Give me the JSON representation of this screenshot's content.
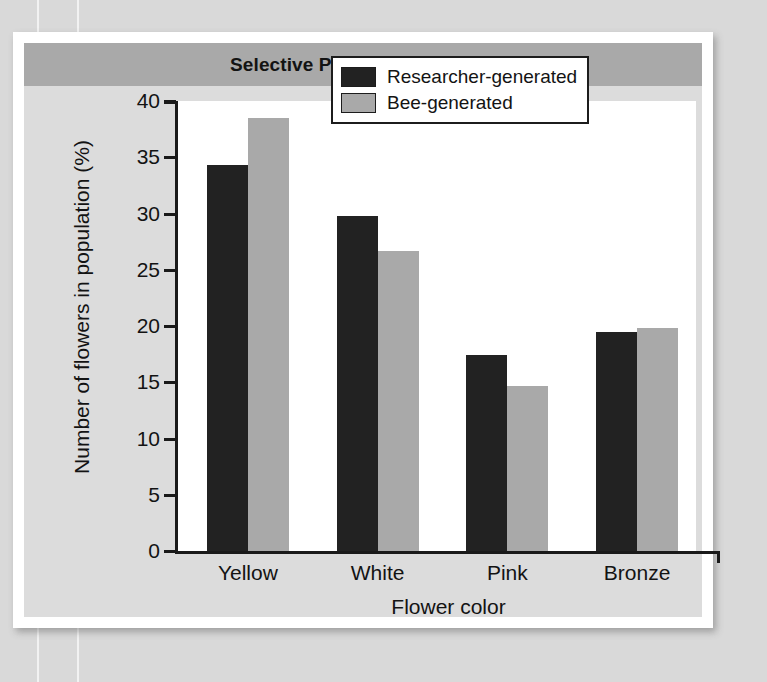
{
  "chart_data": {
    "type": "bar",
    "title": "Selective Pollination by Bees",
    "xlabel": "Flower color",
    "ylabel": "Number of flowers in population (%)",
    "categories": [
      "Yellow",
      "White",
      "Pink",
      "Bronze"
    ],
    "series": [
      {
        "name": "Researcher-generated",
        "color": "#222222",
        "values": [
          34.3,
          29.8,
          17.4,
          19.5
        ]
      },
      {
        "name": "Bee-generated",
        "color": "#a9a9a9",
        "values": [
          38.5,
          26.7,
          14.7,
          19.8
        ]
      }
    ],
    "ylim": [
      0,
      40
    ],
    "yticks": [
      0,
      5,
      10,
      15,
      20,
      25,
      30,
      35,
      40
    ],
    "ytick_labels": [
      "0",
      "5",
      "10",
      "15",
      "20",
      "25",
      "30",
      "35",
      "40"
    ],
    "grid": false,
    "legend_position": "top-right"
  },
  "figure": {
    "title_band_color": "#a9a9a9",
    "panel_color": "#dcdcdc",
    "plot_background": "#ffffff",
    "axis_color": "#1a1a1a"
  }
}
